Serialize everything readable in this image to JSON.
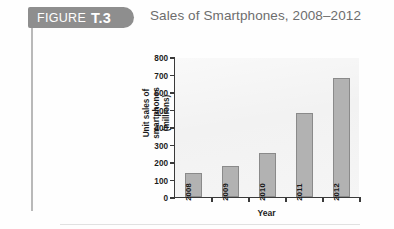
{
  "figure": {
    "badge_word": "FIGURE",
    "badge_number": "T.3",
    "title": "Sales of Smartphones, 2008–2012"
  },
  "chart_data": {
    "type": "bar",
    "title": "Sales of Smartphones, 2008–2012",
    "xlabel": "Year",
    "ylabel": "Unit sales of smartphones (millions)",
    "ylabel_line1": "Unit sales of smartphones",
    "ylabel_line2": "(millions)",
    "categories": [
      "2008",
      "2009",
      "2010",
      "2011",
      "2012"
    ],
    "values": [
      140,
      175,
      250,
      480,
      680
    ],
    "ylim": [
      0,
      800
    ],
    "ytick_step": 100,
    "yticks": [
      "800",
      "700",
      "600",
      "500",
      "400",
      "300",
      "200",
      "100",
      "0"
    ],
    "grid": false,
    "legend": "none",
    "bar_color": "#b2b2b2",
    "bar_border_color": "#8a8a8a",
    "plot_background": "#f2f2f2"
  },
  "colors": {
    "badge_background": "#8e8e8e",
    "badge_text": "#ffffff",
    "title_text": "#6d6d6d",
    "axis": "#3a3a3a",
    "rule": "#b9b9b9"
  }
}
